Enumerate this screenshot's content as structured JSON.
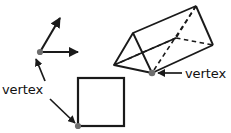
{
  "figure": {
    "background_color": "#ffffff",
    "stroke_color": "#1a1a1a",
    "vertex_dot_color": "#6e6e6e",
    "labels": {
      "left_vertex_label": "vertex",
      "right_vertex_label": "vertex"
    },
    "shapes": {
      "angle": {
        "name": "angle-with-two-rays",
        "vertex_point": [
          40,
          52
        ],
        "ray_up_end": [
          62,
          16
        ],
        "ray_right_end": [
          84,
          52
        ]
      },
      "square": {
        "name": "square",
        "top_left": [
          78,
          78
        ],
        "bottom_right": [
          124,
          126
        ],
        "marked_vertex": [
          78,
          126
        ]
      },
      "prism": {
        "name": "triangular-prism",
        "near_apex": [
          133,
          33
        ],
        "near_left": [
          114,
          65
        ],
        "near_bottom": [
          152,
          73
        ],
        "far_apex": [
          196,
          6
        ],
        "far_right": [
          213,
          45
        ],
        "far_hidden": [
          176,
          38
        ],
        "marked_vertex": [
          152,
          73
        ],
        "hidden_edges": "dashed"
      }
    },
    "pointers": {
      "left_label_to_angle": {
        "from": [
          44,
          80
        ],
        "to": [
          36,
          58
        ]
      },
      "left_label_to_square": {
        "from": [
          50,
          98
        ],
        "to": [
          76,
          124
        ]
      },
      "right_label_to_prism": {
        "from": [
          182,
          73
        ],
        "to": [
          157,
          73
        ]
      }
    }
  }
}
